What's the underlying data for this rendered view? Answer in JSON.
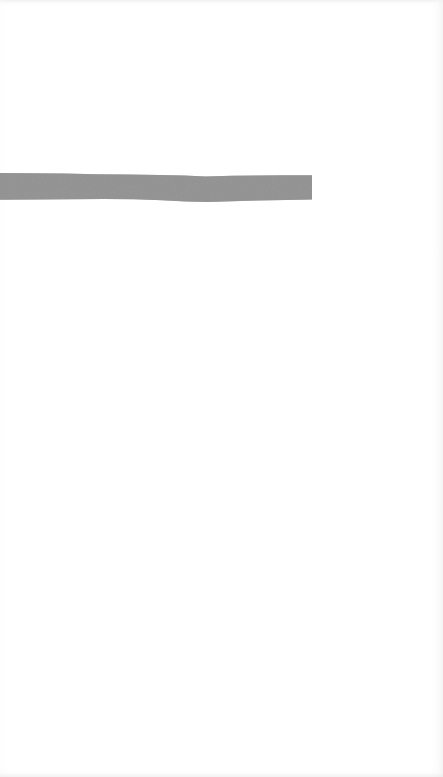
{
  "page": {
    "width_px": 443,
    "height_px": 777,
    "background_color": "#ffffff",
    "paper_tone_color": "#fefefe"
  },
  "marker_stroke": {
    "name": "horizontal-marker-stroke",
    "fill_color": "#8a8a8a",
    "edge_color": "#9a9a9a",
    "starts_at_left_edge": true,
    "start_x_px": 0,
    "end_x_px": 312,
    "top_y_px": 173,
    "bottom_y_px": 201,
    "thickness_px": 26,
    "right_cap_style": "blunt-square",
    "left_cap_style": "bleed-off-edge",
    "path_d": "M 0 173 L 32 173.2 L 64 173.6 L 96 174.2 L 128 174.6 L 160 174.9 L 184 175.6 L 206 176.4 L 232 175.8 L 258 175.4 L 284 175.2 L 312 175.2 L 312 199.6 L 286 199.9 L 258 200.6 L 232 201.2 L 208 202.0 L 186 201.6 L 162 200.2 L 134 199.3 L 104 199.0 L 72 199.2 L 38 199.6 L 0 199.8 Z"
  },
  "scan_artifacts": {
    "top_noise_band": "faint-grey-scanline",
    "bottom_noise_band": "faint-grey-scanline",
    "right_page_edge": "faint-vertical-shadow",
    "left_page_edge": "faint-vertical-shadow"
  }
}
